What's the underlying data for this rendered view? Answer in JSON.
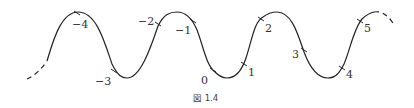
{
  "figure": {
    "caption": "図 1.4",
    "stroke_color": "#222222",
    "label_color": "#333333"
  },
  "curve": {
    "type": "sine-wave",
    "ends": "dashed",
    "peaks_y": 12,
    "troughs_y": 78
  },
  "points": [
    {
      "id": "m4",
      "label": "−4",
      "tick": [
        77,
        13
      ],
      "text": [
        72,
        28
      ]
    },
    {
      "id": "m3",
      "label": "−3",
      "tick": [
        114,
        71
      ],
      "text": [
        95,
        85
      ]
    },
    {
      "id": "m2",
      "label": "−2",
      "tick": [
        158,
        24
      ],
      "text": [
        138,
        25
      ]
    },
    {
      "id": "m1",
      "label": "−1",
      "tick": [
        193,
        21
      ],
      "text": [
        175,
        34
      ]
    },
    {
      "id": "p0",
      "label": "0",
      "tick": [
        213,
        70
      ],
      "text": [
        201,
        84
      ]
    },
    {
      "id": "p1",
      "label": "1",
      "tick": [
        244,
        64
      ],
      "text": [
        248,
        76
      ]
    },
    {
      "id": "p2",
      "label": "2",
      "tick": [
        261,
        19
      ],
      "text": [
        265,
        32
      ]
    },
    {
      "id": "p3",
      "label": "3",
      "tick": [
        304,
        50
      ],
      "text": [
        292,
        58
      ]
    },
    {
      "id": "p4",
      "label": "4",
      "tick": [
        342,
        68
      ],
      "text": [
        346,
        78
      ]
    },
    {
      "id": "p5",
      "label": "5",
      "tick": [
        360,
        21
      ],
      "text": [
        364,
        32
      ]
    }
  ]
}
